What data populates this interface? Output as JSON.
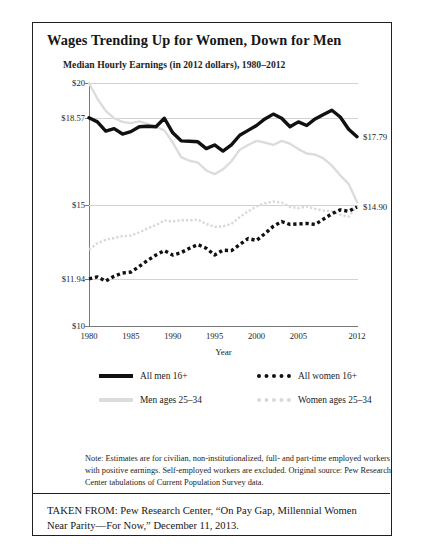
{
  "figure": {
    "title": "Wages Trending Up for Women, Down for Men",
    "subtitle": "Median Hourly Earnings (in 2012 dollars), 1980–2012",
    "note": "Note: Estimates are for civilian, non-institutionalized, full- and part-time employed workers with positive earnings. Self-employed workers are excluded. Original source: Pew Research Center tabulations of Current Population Survey data.",
    "taken_from": "TAKEN FROM: Pew Research Center, “On Pay Gap, Millennial Women Near Parity—For Now,” December 11, 2013."
  },
  "colors": {
    "dark_series": "#111111",
    "light_series": "#dcdcdc",
    "axis": "#7a7a7a",
    "grid": "#d2d2d2",
    "border": "#231f20",
    "text": "#1d1d1d"
  },
  "chart_data": {
    "type": "line",
    "title": "Median Hourly Earnings (in 2012 dollars), 1980–2012",
    "xlabel": "Year",
    "ylabel": "",
    "xlim": [
      1980,
      2012
    ],
    "ylim": [
      10,
      20
    ],
    "grid": true,
    "legend_position": "below",
    "x_ticks": [
      1980,
      1985,
      1990,
      1995,
      2000,
      2005,
      2012
    ],
    "y_ticks": [
      "$20",
      "$18.57",
      "$15",
      "$11.94",
      "$10"
    ],
    "y_tick_values": [
      20,
      18.57,
      15,
      11.94,
      10
    ],
    "x": [
      1980,
      1981,
      1982,
      1983,
      1984,
      1985,
      1986,
      1987,
      1988,
      1989,
      1990,
      1991,
      1992,
      1993,
      1994,
      1995,
      1996,
      1997,
      1998,
      1999,
      2000,
      2001,
      2002,
      2003,
      2004,
      2005,
      2006,
      2007,
      2008,
      2009,
      2010,
      2011,
      2012
    ],
    "series": [
      {
        "name": "All men 16+",
        "style": "solid",
        "color": "#111111",
        "width": "thick",
        "end_label": "$17.79",
        "values": [
          18.57,
          18.4,
          18.02,
          18.12,
          17.9,
          18.0,
          18.2,
          18.22,
          18.2,
          18.55,
          17.95,
          17.62,
          17.6,
          17.58,
          17.3,
          17.45,
          17.2,
          17.45,
          17.85,
          18.05,
          18.25,
          18.52,
          18.72,
          18.55,
          18.2,
          18.4,
          18.25,
          18.52,
          18.7,
          18.88,
          18.6,
          18.1,
          17.79
        ]
      },
      {
        "name": "All women 16+",
        "style": "dotted",
        "color": "#111111",
        "width": "thick",
        "end_label": "$14.90",
        "values": [
          11.94,
          12.02,
          11.85,
          12.05,
          12.18,
          12.22,
          12.45,
          12.7,
          12.92,
          13.1,
          12.92,
          13.02,
          13.2,
          13.35,
          13.2,
          12.92,
          13.12,
          13.1,
          13.35,
          13.6,
          13.52,
          13.8,
          14.1,
          14.3,
          14.18,
          14.2,
          14.22,
          14.18,
          14.4,
          14.62,
          14.78,
          14.72,
          14.9
        ]
      },
      {
        "name": "Men ages 25–34",
        "style": "solid",
        "color": "#dcdcdc",
        "width": "medium",
        "values": [
          20.0,
          19.35,
          18.85,
          18.55,
          18.4,
          18.35,
          18.42,
          18.32,
          18.2,
          18.05,
          17.55,
          16.95,
          16.8,
          16.72,
          16.4,
          16.25,
          16.45,
          16.78,
          17.25,
          17.45,
          17.62,
          17.55,
          17.45,
          17.62,
          17.5,
          17.28,
          17.1,
          17.05,
          16.9,
          16.6,
          16.2,
          15.85,
          15.1
        ]
      },
      {
        "name": "Women ages 25–34",
        "style": "dotted",
        "color": "#d8d8d8",
        "width": "medium",
        "values": [
          13.15,
          13.4,
          13.55,
          13.62,
          13.7,
          13.72,
          13.85,
          14.02,
          14.15,
          14.35,
          14.3,
          14.35,
          14.35,
          14.38,
          14.2,
          14.08,
          14.1,
          14.2,
          14.48,
          14.72,
          14.92,
          15.05,
          15.12,
          15.08,
          14.9,
          14.85,
          14.92,
          14.82,
          14.75,
          14.72,
          14.58,
          14.5,
          14.95
        ]
      }
    ],
    "legend": [
      "All men 16+",
      "All women 16+",
      "Men ages 25–34",
      "Women ages 25–34"
    ],
    "annotations": [
      {
        "text": "$17.79",
        "series": "All men 16+",
        "x": 2012
      },
      {
        "text": "$14.90",
        "series": "All women 16+",
        "x": 2012
      }
    ]
  }
}
